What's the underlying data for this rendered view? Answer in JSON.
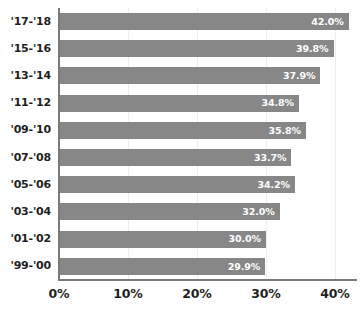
{
  "chart_data": {
    "type": "bar",
    "orientation": "horizontal",
    "title": "",
    "subtitle": "",
    "xlabel": "",
    "ylabel": "",
    "categories": [
      "'17-'18",
      "'15-'16",
      "'13-'14",
      "'11-'12",
      "'09-'10",
      "'07-'08",
      "'05-'06",
      "'03-'04",
      "'01-'02",
      "'99-'00"
    ],
    "values": [
      42.0,
      39.8,
      37.9,
      34.8,
      35.8,
      33.7,
      34.2,
      32.0,
      30.0,
      29.9
    ],
    "data_labels": [
      "42.0%",
      "39.8%",
      "37.9%",
      "34.8%",
      "35.8%",
      "33.7%",
      "34.2%",
      "32.0%",
      "30.0%",
      "29.9%"
    ],
    "xlim": [
      0,
      43.2
    ],
    "xticks": [
      0,
      10,
      20,
      30,
      40
    ],
    "xtick_labels": [
      "0%",
      "10%",
      "20%",
      "30%",
      "40%"
    ],
    "grid": true,
    "grid_axis": "x",
    "legend": false,
    "bar_color": "#878787",
    "data_label_color": "#ffffff",
    "axis_color": "#7a7a7a",
    "text_color": "#1f1f1f",
    "gridline_color": "#ededed",
    "background_color": "#ffffff"
  }
}
